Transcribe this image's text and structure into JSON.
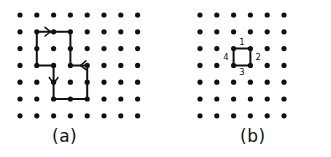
{
  "figure": {
    "background_color": "#ffffff",
    "ink_color": "#111111",
    "panels": [
      {
        "id": "panel-a",
        "caption": "(a)",
        "lattice": {
          "type": "square-dot-lattice",
          "columns": 8,
          "rows": 7,
          "origin_x": 20,
          "origin_y": 15,
          "spacing": 16.8,
          "dot_radius": 2.6
        },
        "polygon": {
          "name": "self-avoiding-walk-outline",
          "closed": true,
          "stroke_width": 2.0,
          "vertices_grid": [
            [
              1,
              1
            ],
            [
              3,
              1
            ],
            [
              3,
              3
            ],
            [
              4,
              3
            ],
            [
              4,
              5
            ],
            [
              2,
              5
            ],
            [
              2,
              3
            ],
            [
              1,
              3
            ]
          ]
        },
        "arrows": [
          {
            "name": "arrow-right-top-edge",
            "direction": "right",
            "grid_x": 1.75,
            "grid_y": 1
          },
          {
            "name": "arrow-left-middle-edge",
            "direction": "left",
            "grid_x": 3.7,
            "grid_y": 3
          },
          {
            "name": "arrow-down-left-edge",
            "direction": "down",
            "grid_x": 2,
            "grid_y": 3.85
          }
        ]
      },
      {
        "id": "panel-b",
        "caption": "(b)",
        "lattice": {
          "type": "square-dot-lattice",
          "columns": 6,
          "rows": 7,
          "origin_x": 200,
          "origin_y": 15,
          "spacing": 16.8,
          "dot_radius": 2.6
        },
        "polygon": {
          "name": "unit-square-outline",
          "closed": true,
          "stroke_width": 2.0,
          "vertices_grid": [
            [
              2,
              2
            ],
            [
              3,
              2
            ],
            [
              3,
              3
            ],
            [
              2,
              3
            ]
          ]
        },
        "edge_labels": [
          {
            "name": "edge-label-1",
            "text": "1",
            "position": "top"
          },
          {
            "name": "edge-label-2",
            "text": "2",
            "position": "right"
          },
          {
            "name": "edge-label-3",
            "text": "3",
            "position": "bottom"
          },
          {
            "name": "edge-label-4",
            "text": "4",
            "position": "left"
          }
        ]
      }
    ]
  }
}
